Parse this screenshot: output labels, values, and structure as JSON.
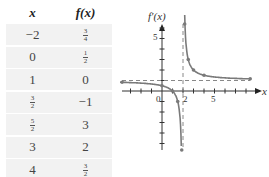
{
  "table": {
    "headers": [
      "x",
      "f(x)"
    ],
    "rows": [
      {
        "x": {
          "type": "int",
          "text": "−2"
        },
        "fx": {
          "type": "frac",
          "num": "3",
          "den": "4"
        }
      },
      {
        "x": {
          "type": "int",
          "text": "0"
        },
        "fx": {
          "type": "frac",
          "num": "1",
          "den": "2"
        }
      },
      {
        "x": {
          "type": "int",
          "text": "1"
        },
        "fx": {
          "type": "int",
          "text": "0"
        }
      },
      {
        "x": {
          "type": "frac",
          "num": "3",
          "den": "2"
        },
        "fx": {
          "type": "int",
          "text": "−1"
        }
      },
      {
        "x": {
          "type": "frac",
          "num": "5",
          "den": "2"
        },
        "fx": {
          "type": "int",
          "text": "3"
        }
      },
      {
        "x": {
          "type": "int",
          "text": "3"
        },
        "fx": {
          "type": "int",
          "text": "2"
        }
      },
      {
        "x": {
          "type": "int",
          "text": "4"
        },
        "fx": {
          "type": "frac",
          "num": "3",
          "den": "2"
        }
      }
    ]
  },
  "graph": {
    "y_label": "f′(x)",
    "x_label": "x",
    "tick_labels": {
      "origin": "0",
      "x2": "2",
      "x5": "5",
      "y5": "5"
    },
    "vertical_asymptote_x": 2,
    "horizontal_asymptote_y": 1,
    "curve_color": "#808080",
    "asymptote_color": "#888888"
  }
}
